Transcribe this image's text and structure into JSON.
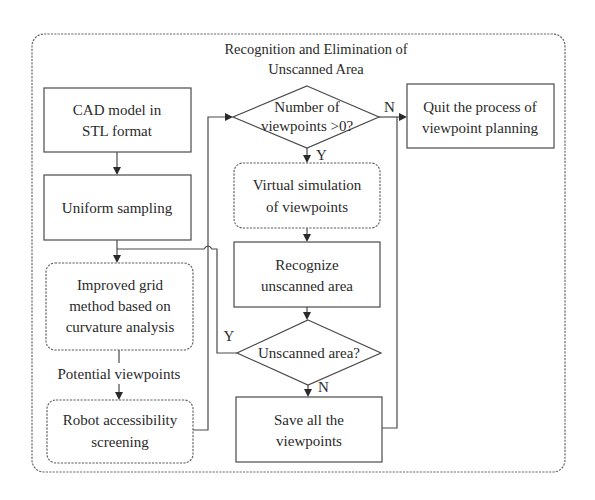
{
  "diagram": {
    "title_line1": "Recognition and Elimination of",
    "title_line2": "Unscanned Area",
    "nodes": {
      "cad_model": {
        "line1": "CAD model in",
        "line2": "STL format"
      },
      "uniform_sampling": {
        "line1": "Uniform sampling"
      },
      "improved_grid": {
        "line1": "Improved grid",
        "line2": "method based on",
        "line3": "curvature analysis"
      },
      "robot_accessibility": {
        "line1": "Robot accessibility",
        "line2": "screening"
      },
      "number_viewpoints": {
        "line1": "Number of",
        "line2": "viewpoints >0?"
      },
      "quit_process": {
        "line1": "Quit the process of",
        "line2": "viewpoint planning"
      },
      "virtual_simulation": {
        "line1": "Virtual simulation",
        "line2": "of viewpoints"
      },
      "recognize_unscanned": {
        "line1": "Recognize",
        "line2": "unscanned area"
      },
      "unscanned_area_decision": {
        "line1": "Unscanned area?"
      },
      "save_viewpoints": {
        "line1": "Save all the",
        "line2": "viewpoints"
      }
    },
    "edge_labels": {
      "potential_viewpoints": "Potential viewpoints",
      "number_no": "N",
      "number_yes": "Y",
      "unscanned_yes": "Y",
      "unscanned_no": "N"
    },
    "colors": {
      "stroke": "#4a4a4a",
      "text": "#2a2a2a",
      "background": "#ffffff"
    }
  }
}
